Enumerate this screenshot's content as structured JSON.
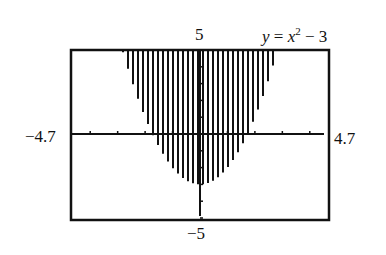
{
  "figure": {
    "equation": {
      "y": "y",
      "eq": " = ",
      "x": "x",
      "exp": "2",
      "rest": " − 3"
    },
    "labels": {
      "ymax": "5",
      "ymin": "−5",
      "xmin": "−4.7",
      "xmax": "4.7"
    }
  },
  "chart_data": {
    "type": "area",
    "function": "y = x^2 - 3",
    "shading": "above curve (y >= x^2 - 3), vertical line hatching",
    "window": {
      "xmin": -4.7,
      "xmax": 4.7,
      "ymin": -5,
      "ymax": 5
    },
    "xlim": [
      -4.7,
      4.7
    ],
    "ylim": [
      -5,
      5
    ],
    "tick_labels": {
      "x": [
        "−4.7",
        "4.7"
      ],
      "y": [
        "5",
        "−5"
      ]
    },
    "x_ticks_spacing": 1,
    "y_ticks_spacing": 1,
    "vertex": [
      0,
      -3
    ],
    "x_intercepts": [
      -1.732,
      1.732
    ],
    "grid": false,
    "legend": "none"
  }
}
